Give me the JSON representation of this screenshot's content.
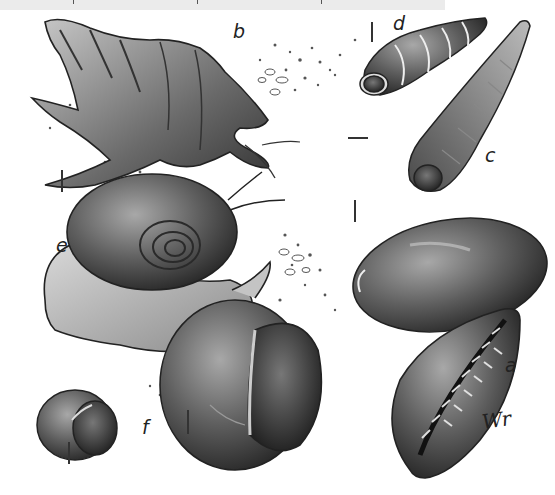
{
  "figure": {
    "style": "grayscale pencil illustration",
    "top_band": {
      "color": "#ebebeb",
      "tick_positions": [
        73,
        197,
        321
      ]
    },
    "specimens": [
      {
        "id": "a",
        "label": "a",
        "description": "cowrie shell (aperture view)"
      },
      {
        "id": "b",
        "label": "b",
        "description": "spider conch with long spines"
      },
      {
        "id": "c",
        "label": "c",
        "description": "auger / tower shell"
      },
      {
        "id": "d",
        "label": "d",
        "description": "small ribbed turret shell"
      },
      {
        "id": "e",
        "label": "e",
        "description": "moon snail with extended foot"
      },
      {
        "id": "f",
        "label": "f",
        "description": "small snail shell (aperture view)"
      }
    ],
    "extra_specimens": [
      {
        "id": "cowrie-dorsal",
        "description": "cowrie shell (dorsal view)"
      },
      {
        "id": "snail-large-aperture",
        "description": "large snail shell (aperture view)"
      }
    ],
    "signature": "Wr",
    "colors": {
      "ink": "#222222",
      "shade_dark": "#3a3a3a",
      "shade_mid": "#6e6e6e",
      "shade_light": "#b8b8b8",
      "paper": "#ffffff"
    }
  }
}
